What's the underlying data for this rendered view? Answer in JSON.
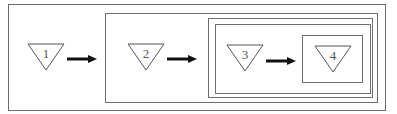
{
  "diagram": {
    "type": "nested-containment",
    "nodes": [
      {
        "id": "1",
        "label": "1",
        "shape": "inverted-triangle"
      },
      {
        "id": "2",
        "label": "2",
        "shape": "inverted-triangle"
      },
      {
        "id": "3",
        "label": "3",
        "shape": "inverted-triangle"
      },
      {
        "id": "4",
        "label": "4",
        "shape": "inverted-triangle"
      }
    ],
    "edges": [
      {
        "from": "1",
        "to": "2"
      },
      {
        "from": "2",
        "to": "3"
      },
      {
        "from": "3",
        "to": "4"
      }
    ],
    "containers": [
      {
        "id": "outer",
        "contains": [
          "1",
          "box-2"
        ]
      },
      {
        "id": "box-2",
        "contains": [
          "2",
          "box-3"
        ]
      },
      {
        "id": "box-3",
        "contains": [
          "3",
          "box-4"
        ]
      },
      {
        "id": "box-4",
        "contains": [
          "4"
        ]
      }
    ],
    "colors": {
      "line": "#6e6e6e",
      "arrow": "#111111"
    }
  }
}
